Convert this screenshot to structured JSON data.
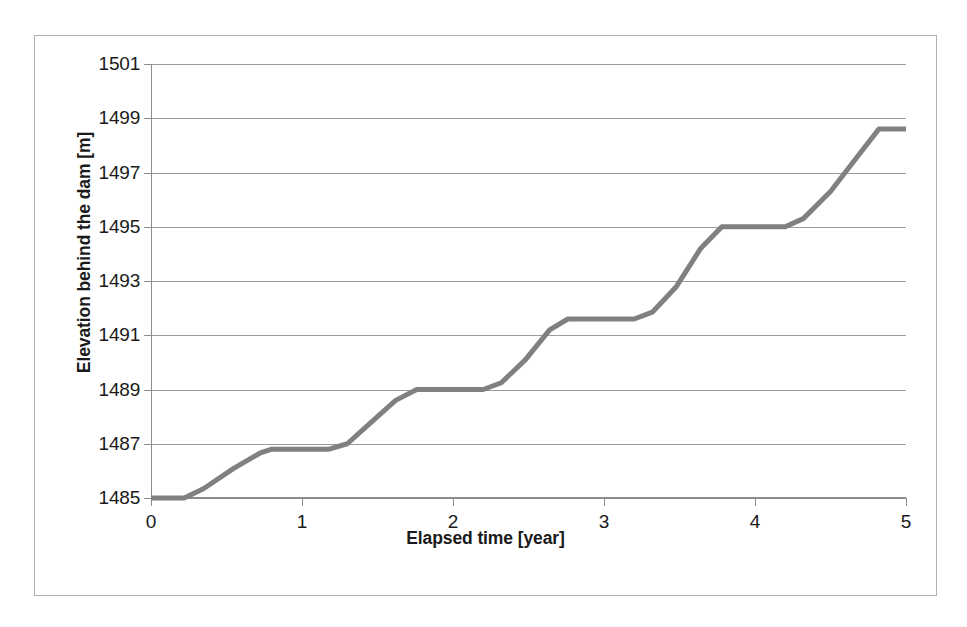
{
  "chart_data": {
    "type": "line",
    "title": "",
    "xlabel": "Elapsed time [year]",
    "ylabel": "Elevation behind the dam [m]",
    "xlim": [
      0,
      5
    ],
    "ylim": [
      1485,
      1501
    ],
    "grid": true,
    "legend": "none",
    "line_color": "#808080",
    "line_width_px": 5,
    "xticks": [
      0,
      1,
      2,
      3,
      4,
      5
    ],
    "xtick_labels": [
      "0",
      "1",
      "2",
      "3",
      "4",
      "5"
    ],
    "yticks": [
      1485,
      1487,
      1489,
      1491,
      1493,
      1495,
      1497,
      1499,
      1501
    ],
    "ytick_labels": [
      "1485",
      "1487",
      "1489",
      "1491",
      "1493",
      "1495",
      "1497",
      "1499",
      "1501"
    ],
    "series": [
      {
        "name": "Elevation behind the dam",
        "x": [
          0.0,
          0.22,
          0.35,
          0.55,
          0.72,
          0.8,
          1.18,
          1.3,
          1.45,
          1.62,
          1.76,
          2.2,
          2.32,
          2.48,
          2.64,
          2.76,
          3.2,
          3.32,
          3.48,
          3.64,
          3.78,
          4.2,
          4.32,
          4.5,
          4.68,
          4.82,
          5.0
        ],
        "y": [
          1485.0,
          1485.0,
          1485.35,
          1486.1,
          1486.65,
          1486.8,
          1486.8,
          1487.0,
          1487.75,
          1488.6,
          1489.0,
          1489.0,
          1489.25,
          1490.1,
          1491.2,
          1491.6,
          1491.6,
          1491.85,
          1492.8,
          1494.2,
          1495.0,
          1495.0,
          1495.3,
          1496.3,
          1497.6,
          1498.6,
          1498.6
        ]
      }
    ],
    "plateaus": [
      {
        "level": 1485.0,
        "from_year": 0.0,
        "to_year": 0.22
      },
      {
        "level": 1486.8,
        "from_year": 0.8,
        "to_year": 1.18
      },
      {
        "level": 1489.0,
        "from_year": 1.76,
        "to_year": 2.2
      },
      {
        "level": 1491.6,
        "from_year": 2.76,
        "to_year": 3.2
      },
      {
        "level": 1495.0,
        "from_year": 3.78,
        "to_year": 4.2
      },
      {
        "level": 1498.6,
        "from_year": 4.82,
        "to_year": 5.0
      }
    ]
  }
}
